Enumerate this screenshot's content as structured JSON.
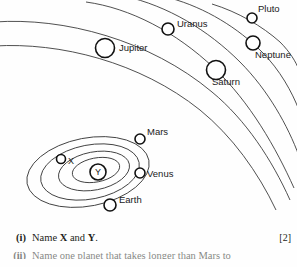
{
  "diagram": {
    "name": "solar-system-orbit-diagram",
    "outer_planets": [
      {
        "id": "jupiter",
        "label": "Jupiter",
        "cx": 105,
        "cy": 48,
        "r": 9.5,
        "label_x": 119,
        "label_y": 51
      },
      {
        "id": "uranus",
        "label": "Uranus",
        "cx": 168,
        "cy": 29,
        "r": 6.0,
        "label_x": 177,
        "label_y": 27
      },
      {
        "id": "pluto",
        "label": "Pluto",
        "cx": 252,
        "cy": 18,
        "r": 5.0,
        "label_x": 258,
        "label_y": 12
      },
      {
        "id": "neptune",
        "label": "Neptune",
        "cx": 253,
        "cy": 43,
        "r": 7.0,
        "label_x": 255,
        "label_y": 58
      },
      {
        "id": "saturn",
        "label": "Saturn",
        "cx": 216,
        "cy": 70,
        "r": 9.5,
        "label_x": 212,
        "label_y": 85
      }
    ],
    "inner_planets": [
      {
        "id": "mars",
        "label": "Mars",
        "cx": 140,
        "cy": 139,
        "r": 5.0,
        "label_x": 147,
        "label_y": 135
      },
      {
        "id": "venus",
        "label": "Venus",
        "cx": 140,
        "cy": 173,
        "r": 5.0,
        "label_x": 147,
        "label_y": 177
      },
      {
        "id": "earth",
        "label": "Earth",
        "cx": 110,
        "cy": 205,
        "r": 6.0,
        "label_x": 119,
        "label_y": 203
      },
      {
        "id": "marker-x",
        "label": "X",
        "cx": 61,
        "cy": 159,
        "r": 4.5,
        "label_x": 68,
        "label_y": 164
      },
      {
        "id": "marker-y",
        "label": "Y",
        "cx": 98,
        "cy": 172,
        "r": 8.0,
        "label_x": 98,
        "label_y": 175
      }
    ],
    "inner_orbits": [
      {
        "id": "orbit-4",
        "rx": 62,
        "ry": 34
      },
      {
        "id": "orbit-3",
        "rx": 50,
        "ry": 27
      },
      {
        "id": "orbit-2",
        "rx": 36,
        "ry": 19
      },
      {
        "id": "orbit-1",
        "rx": 24,
        "ry": 12
      }
    ],
    "outer_orbit_count": 6
  },
  "questions": [
    {
      "number": "(i)",
      "text_before": "Name ",
      "bold_a": "X",
      "text_mid": " and ",
      "bold_b": "Y",
      "text_after": ".",
      "marks": "[2]"
    },
    {
      "number": "(ii)",
      "text": "Name one planet that takes longer than Mars to",
      "marks": ""
    }
  ],
  "colors": {
    "ink": "#231f20",
    "orbit_stroke": "#3c3c3c",
    "planet_stroke": "#111111",
    "background": "#fefefe"
  }
}
